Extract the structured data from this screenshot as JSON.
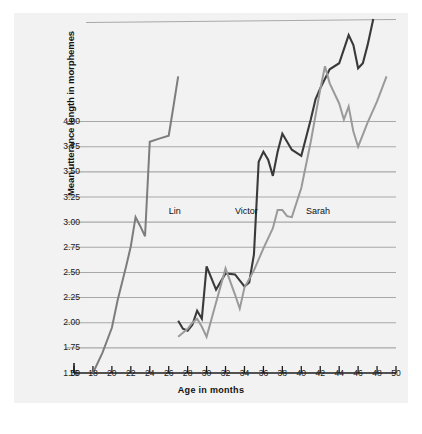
{
  "figure": {
    "background": "#ffffff",
    "panel_background": "#f2f2f2"
  },
  "chart_data": {
    "type": "line",
    "title": "",
    "xlabel": "Age in months",
    "ylabel": "Mean utterance length in morphemes",
    "xlim": [
      16,
      50
    ],
    "ylim": [
      1.5,
      5.0
    ],
    "xticks": [
      16,
      18,
      20,
      22,
      24,
      26,
      28,
      30,
      32,
      34,
      36,
      38,
      40,
      42,
      44,
      46,
      48,
      50
    ],
    "xtick_labels": [
      "16",
      "18",
      "20",
      "22",
      "24",
      "26",
      "28",
      "30",
      "32",
      "34",
      "36",
      "38",
      "40",
      "42",
      "44",
      "46",
      "48",
      "50"
    ],
    "yticks": [
      1.5,
      1.75,
      2.0,
      2.25,
      2.5,
      2.75,
      3.0,
      3.25,
      3.5,
      3.75,
      4.0
    ],
    "ytick_labels": [
      "1.50",
      "1.75",
      "2.00",
      "2.25",
      "2.50",
      "2.75",
      "3.00",
      "3.25",
      "3.50",
      "3.75",
      "4.00"
    ],
    "extra_gridlines": [
      5.0
    ],
    "grid": true,
    "grid_orientation": "horizontal",
    "grid_color": "#a8a8a8",
    "legend_position": "inline-annotations",
    "series": [
      {
        "name": "Lin",
        "color": "#7d7d7d",
        "linewidth": 2.0,
        "label_position": {
          "x": 26.0,
          "y": 3.1
        },
        "x": [
          18.0,
          19.0,
          20.0,
          20.6,
          21.5,
          22.0,
          22.5,
          23.0,
          23.5,
          24.0,
          25.0,
          26.0,
          26.5,
          27.0
        ],
        "y": [
          1.5,
          1.7,
          1.95,
          2.22,
          2.56,
          2.76,
          3.05,
          2.96,
          2.86,
          3.8,
          3.83,
          3.86,
          4.15,
          4.45
        ]
      },
      {
        "name": "Victor",
        "color": "#3a3a3a",
        "linewidth": 2.1,
        "label_position": {
          "x": 33.0,
          "y": 3.1
        },
        "x": [
          27.0,
          27.5,
          28.0,
          28.5,
          29.0,
          29.5,
          30.0,
          31.0,
          32.0,
          33.0,
          34.0,
          34.5,
          35.0,
          35.5,
          36.0,
          36.5,
          37.0,
          37.5,
          38.0,
          38.5,
          39.0,
          40.0,
          41.0,
          41.5,
          42.0,
          43.0,
          44.0,
          45.0,
          45.5,
          46.0,
          46.5,
          47.0,
          47.6
        ],
        "y": [
          2.02,
          1.94,
          1.92,
          1.98,
          2.12,
          2.04,
          2.56,
          2.33,
          2.49,
          2.48,
          2.36,
          2.4,
          2.68,
          3.6,
          3.7,
          3.62,
          3.46,
          3.7,
          3.88,
          3.8,
          3.72,
          3.66,
          4.02,
          4.22,
          4.33,
          4.52,
          4.58,
          4.86,
          4.76,
          4.53,
          4.58,
          4.76,
          5.02
        ]
      },
      {
        "name": "Sarah",
        "color": "#9a9a9a",
        "linewidth": 2.0,
        "label_position": {
          "x": 40.5,
          "y": 3.1
        },
        "x": [
          27.0,
          27.5,
          28.0,
          28.5,
          29.0,
          29.5,
          30.0,
          31.0,
          32.0,
          33.0,
          33.5,
          34.0,
          35.0,
          36.0,
          37.0,
          37.5,
          38.0,
          38.5,
          39.0,
          40.0,
          41.0,
          42.0,
          42.5,
          43.0,
          44.0,
          44.5,
          45.0,
          45.5,
          46.0,
          47.0,
          48.0,
          49.0
        ],
        "y": [
          1.86,
          1.9,
          1.94,
          2.0,
          2.04,
          1.96,
          1.86,
          2.2,
          2.54,
          2.28,
          2.14,
          2.35,
          2.52,
          2.74,
          2.94,
          3.12,
          3.12,
          3.06,
          3.05,
          3.34,
          3.8,
          4.32,
          4.55,
          4.38,
          4.18,
          4.02,
          4.15,
          3.9,
          3.75,
          3.99,
          4.2,
          4.45
        ]
      }
    ]
  }
}
